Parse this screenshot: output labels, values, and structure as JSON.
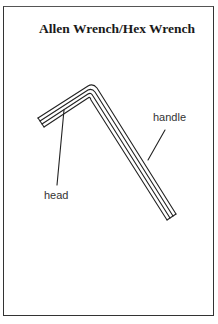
{
  "diagram": {
    "title": "Allen Wrench/Hex Wrench",
    "labels": {
      "handle": "handle",
      "head": "head"
    },
    "colors": {
      "stroke": "#222222",
      "background": "#ffffff"
    }
  }
}
